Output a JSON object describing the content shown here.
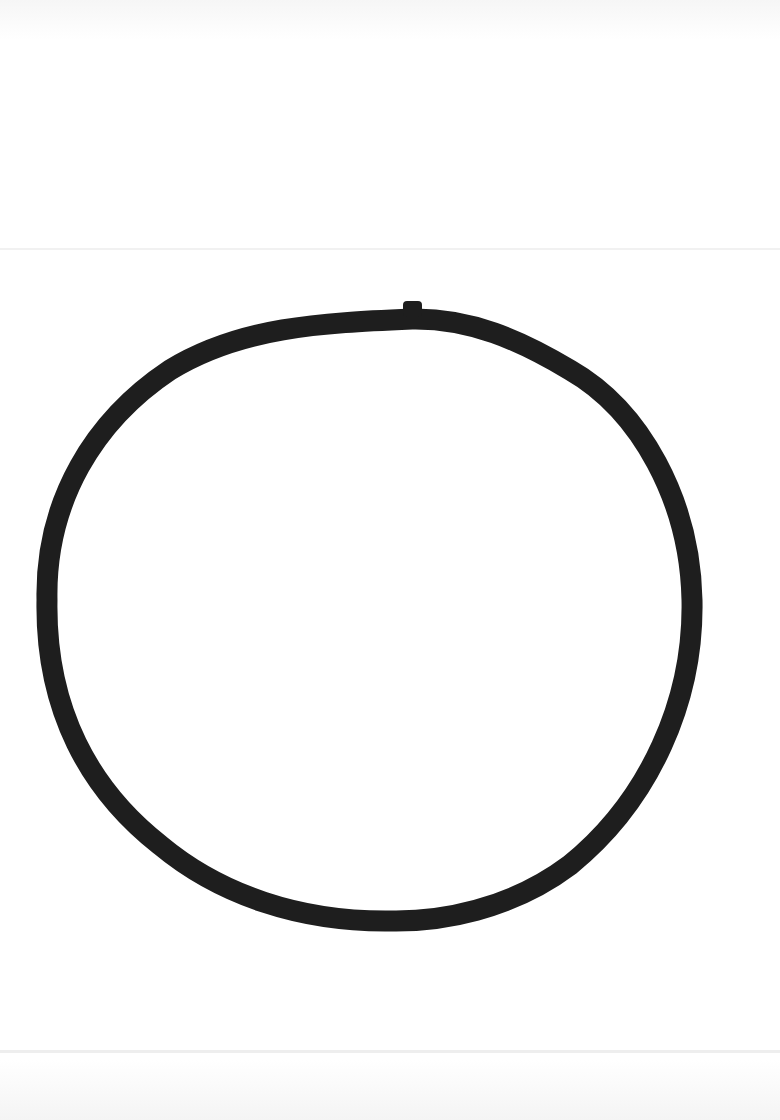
{
  "image": {
    "description": "Hand-drawn black ink circle on white paper",
    "background_color": "#ffffff",
    "ink_color": "#1e1e1e",
    "shape": {
      "type": "circle",
      "center": [
        370,
        622
      ],
      "radius_x": 322,
      "radius_y": 300,
      "stroke_width": 21,
      "mark": "small bump at top of stroke near x=412"
    }
  }
}
